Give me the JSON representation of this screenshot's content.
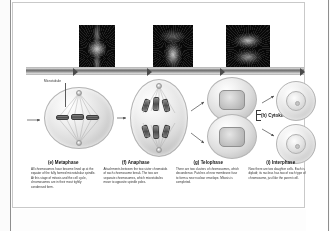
{
  "figure": {
    "timeline_label": "mitosis-timeline-arrow"
  },
  "annotations": {
    "microtubule": "Microtubule",
    "cytokinesis": "(h) Cytokinesis"
  },
  "micrographs": [
    {
      "name": "metaphase-micrograph",
      "caption": ""
    },
    {
      "name": "anaphase-micrograph",
      "caption": ""
    },
    {
      "name": "telophase-micrograph",
      "caption": ""
    }
  ],
  "cells": [
    {
      "name": "metaphase-cell"
    },
    {
      "name": "anaphase-cell"
    },
    {
      "name": "telophase-cell"
    },
    {
      "name": "interphase-cell-top"
    },
    {
      "name": "interphase-cell-bottom"
    }
  ],
  "captions": [
    {
      "id": "metaphase",
      "heading": "(e) Metaphase",
      "body": "All chromosomes have become lined up at the equator of the fully formed microtubular spindle. At this stage of mitosis and the cell cycle, chromosomes are in their most tightly condensed form."
    },
    {
      "id": "anaphase",
      "heading": "(f) Anaphase",
      "body": "Attachments between the two sister chromatids of each chromosome break. The two are separate chromosomes, which microtubules move to opposite spindle poles."
    },
    {
      "id": "telophase",
      "heading": "(g) Telophase",
      "body": "There are two clusters of chromosomes, which decondense. Patches of new membrane fuse to form a new nuclear envelope. Mitosis is completed."
    },
    {
      "id": "interphase",
      "heading": "(i) Interphase",
      "body": "Now there are two daughter cells. Each is diploid; its nucleus has two of each type of chromosome, just like the parent cell."
    }
  ],
  "colors": {
    "page_background": "#fbfbfb",
    "panel_background": "#ffffff",
    "panel_border": "#c9c9c9",
    "timeline_bar": "#6f6f6f",
    "text_primary": "#111111",
    "text_body": "#333333",
    "micrograph_background": "#0a0a0a"
  }
}
